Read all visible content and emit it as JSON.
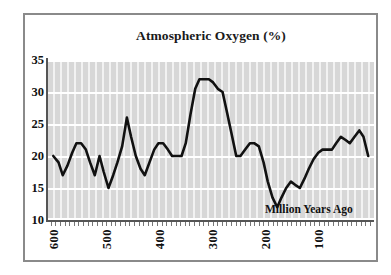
{
  "chart_data": {
    "type": "line",
    "title": "Atmospheric Oxygen (%)",
    "xlabel": "Million Years Ago",
    "ylabel": "",
    "xlim": [
      620,
      0
    ],
    "ylim": [
      10,
      35
    ],
    "x_ticks": [
      600,
      500,
      400,
      300,
      200,
      100
    ],
    "y_ticks": [
      10,
      15,
      20,
      25,
      30,
      35
    ],
    "grid": true,
    "legend": false,
    "x_axis_reversed": true,
    "annotation": "Million Years Ago",
    "series": [
      {
        "name": "Atmospheric Oxygen",
        "color": "#111111",
        "x": [
          610,
          600,
          592,
          583,
          574,
          566,
          557,
          548,
          540,
          531,
          522,
          514,
          505,
          496,
          488,
          479,
          470,
          462,
          453,
          444,
          436,
          427,
          418,
          410,
          401,
          392,
          384,
          375,
          366,
          358,
          349,
          340,
          332,
          323,
          314,
          306,
          297,
          288,
          280,
          271,
          262,
          254,
          245,
          236,
          228,
          219,
          210,
          202,
          193,
          184,
          176,
          167,
          158,
          150,
          141,
          132,
          124,
          115,
          106,
          98,
          89,
          80,
          72,
          63,
          54,
          46,
          37,
          28,
          20,
          11
        ],
        "y": [
          20.0,
          19.0,
          17.0,
          18.5,
          20.5,
          22.0,
          22.0,
          21.0,
          19.0,
          17.0,
          20.0,
          17.5,
          15.0,
          17.0,
          19.0,
          21.5,
          26.0,
          23.0,
          20.0,
          18.0,
          17.0,
          19.0,
          21.0,
          22.0,
          22.0,
          21.0,
          20.0,
          20.0,
          20.0,
          22.0,
          26.5,
          30.5,
          32.0,
          32.0,
          32.0,
          31.5,
          30.5,
          30.0,
          27.0,
          23.5,
          20.0,
          20.0,
          21.0,
          22.0,
          22.0,
          21.5,
          19.0,
          16.0,
          13.5,
          12.0,
          13.5,
          15.0,
          16.0,
          15.5,
          15.0,
          16.5,
          18.0,
          19.5,
          20.5,
          21.0,
          21.0,
          21.0,
          22.0,
          23.0,
          22.5,
          22.0,
          23.0,
          24.0,
          23.0,
          20.0
        ]
      }
    ]
  },
  "figure": {
    "title": "Atmospheric Oxygen (%)",
    "x_axis_annotation": "Million Years Ago",
    "y_tick_labels": [
      "35",
      "30",
      "25",
      "20",
      "15",
      "10"
    ],
    "x_tick_labels": [
      "600",
      "500",
      "400",
      "300",
      "200",
      "100"
    ],
    "colors": {
      "line": "#111111",
      "plot_background": "#d9d9d9",
      "stripe_light": "#f2f2f2",
      "gridline": "#ffffff",
      "frame": "#8a8a8a",
      "axis": "#555555",
      "text": "#111111"
    }
  }
}
